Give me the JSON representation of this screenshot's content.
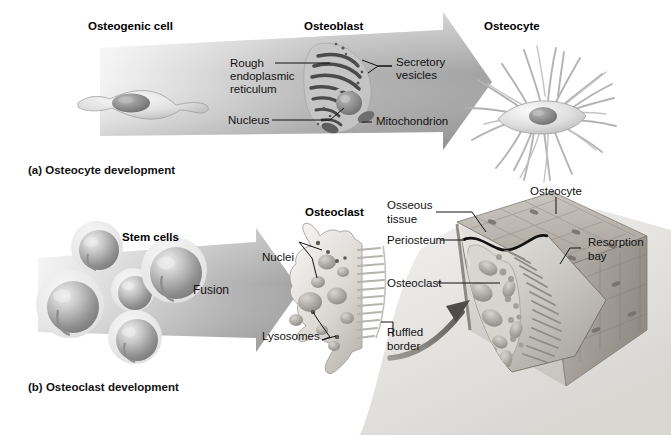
{
  "figure": {
    "title_a": "(a) Osteocyte development",
    "title_b": "(b) Osteoclast development",
    "background": "#ffffff",
    "ink": "#111111"
  },
  "panel_a": {
    "headings": [
      {
        "name": "osteogenic-cell",
        "text": "Osteogenic cell"
      },
      {
        "name": "osteoblast",
        "text": "Osteoblast"
      },
      {
        "name": "osteocyte",
        "text": "Osteocyte"
      }
    ],
    "callouts": [
      {
        "name": "rough-er",
        "line1": "Rough",
        "line2": "endoplasmic",
        "line3": "reticulum"
      },
      {
        "name": "secretory-vesicles",
        "line1": "Secretory",
        "line2": "vesicles"
      },
      {
        "name": "nucleus",
        "line1": "Nucleus"
      },
      {
        "name": "mitochondrion",
        "line1": "Mitochondrion"
      }
    ],
    "arrow_color_start": "#e9e9e9",
    "arrow_color_end": "#9a9a9a"
  },
  "panel_b": {
    "headings": [
      {
        "name": "stem-cells",
        "text": "Stem cells"
      },
      {
        "name": "osteoclast",
        "text": "Osteoclast"
      }
    ],
    "arrow_label": "Fusion",
    "callouts": [
      {
        "name": "nuclei",
        "line1": "Nuclei"
      },
      {
        "name": "lysosomes",
        "line1": "Lysosomes"
      },
      {
        "name": "osseous-tissue",
        "line1": "Osseous",
        "line2": "tissue"
      },
      {
        "name": "periosteum",
        "line1": "Periosteum"
      },
      {
        "name": "osteoclast-bone",
        "line1": "Osteoclast"
      },
      {
        "name": "ruffled-border",
        "line1": "Ruffled",
        "line2": "border"
      },
      {
        "name": "osteocyte-bone",
        "line1": "Osteocyte"
      },
      {
        "name": "resorption-bay",
        "line1": "Resorption",
        "line2": "bay"
      }
    ],
    "stem_cell_count": 5,
    "arrow_color_start": "#ececec",
    "arrow_color_end": "#a3a3a3"
  }
}
